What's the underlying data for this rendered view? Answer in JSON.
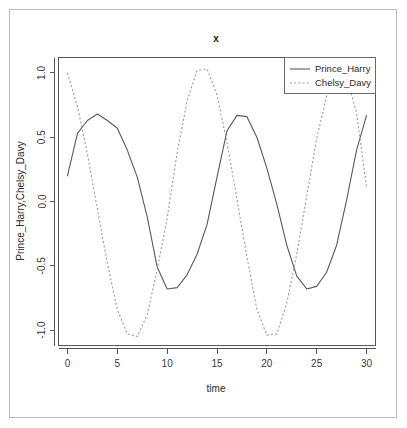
{
  "window": {
    "background_color": "#ffffff",
    "border_color": "#b9b9b9"
  },
  "chart_data": {
    "type": "line",
    "title": "x",
    "subtitle": "",
    "xlabel": "time",
    "ylabel": "Prince_Harry,Chelsy_Davy",
    "xlim": [
      -0.9,
      30.9
    ],
    "ylim": [
      -1.12,
      1.12
    ],
    "xticks": [
      0,
      5,
      10,
      15,
      20,
      25,
      30
    ],
    "xtick_labels": [
      "0",
      "5",
      "10",
      "15",
      "20",
      "25",
      "30"
    ],
    "yticks": [
      1.0,
      0.5,
      0.0,
      -0.5,
      -1.0
    ],
    "ytick_labels": [
      "1.0",
      "0.5",
      "0.0",
      "-0.5",
      "-1.0"
    ],
    "grid": false,
    "legend_position": "top-right",
    "frame": true,
    "x": [
      0,
      1,
      2,
      3,
      4,
      5,
      6,
      7,
      8,
      9,
      10,
      11,
      12,
      13,
      14,
      15,
      16,
      17,
      18,
      19,
      20,
      21,
      22,
      23,
      24,
      25,
      26,
      27,
      28,
      29,
      30
    ],
    "series": [
      {
        "name": "Prince_Harry",
        "style": "solid",
        "color": "#595959",
        "values": [
          0.2,
          0.53,
          0.63,
          0.68,
          0.63,
          0.57,
          0.4,
          0.19,
          -0.12,
          -0.51,
          -0.68,
          -0.67,
          -0.57,
          -0.41,
          -0.18,
          0.19,
          0.55,
          0.67,
          0.66,
          0.5,
          0.26,
          -0.02,
          -0.34,
          -0.58,
          -0.68,
          -0.66,
          -0.55,
          -0.34,
          0.01,
          0.4,
          0.67
        ]
      },
      {
        "name": "Chelsy_Davy",
        "style": "dashed",
        "color": "#9a9a9a",
        "values": [
          1.0,
          0.74,
          0.37,
          -0.06,
          -0.48,
          -0.84,
          -1.03,
          -1.05,
          -0.88,
          -0.53,
          -0.13,
          0.38,
          0.78,
          1.02,
          1.03,
          0.83,
          0.46,
          0.02,
          -0.43,
          -0.84,
          -1.04,
          -1.03,
          -0.79,
          -0.41,
          0.04,
          0.49,
          0.82,
          1.0,
          0.97,
          0.69,
          0.11
        ]
      }
    ]
  },
  "legend": {
    "entries": [
      {
        "label": "Prince_Harry",
        "style": "solid"
      },
      {
        "label": "Chelsy_Davy",
        "style": "dashed"
      }
    ]
  }
}
